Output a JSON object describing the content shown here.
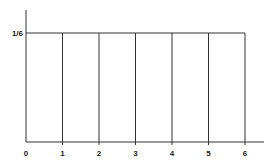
{
  "chart_data": {
    "type": "bar",
    "title": "",
    "xlabel": "",
    "ylabel": "",
    "categories": [
      "0-1",
      "1-2",
      "2-3",
      "3-4",
      "4-5",
      "5-6"
    ],
    "x_ticks": [
      "0",
      "1",
      "2",
      "3",
      "4",
      "5",
      "6"
    ],
    "y_ticks": [
      "1/6"
    ],
    "values": [
      0.1667,
      0.1667,
      0.1667,
      0.1667,
      0.1667,
      0.1667
    ],
    "xlim": [
      0,
      6.5
    ],
    "ylim": [
      0,
      0.2
    ],
    "grid": false,
    "legend": null
  },
  "colors": {
    "line": "#333333",
    "background": "#ffffff"
  }
}
